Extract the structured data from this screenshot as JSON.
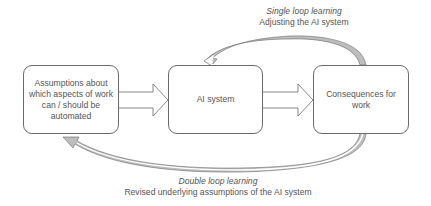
{
  "diagram": {
    "nodes": [
      {
        "id": "assumptions",
        "label": "Assumptions about which aspects of work can / should be automated"
      },
      {
        "id": "ai_system",
        "label": "AI system"
      },
      {
        "id": "consequences",
        "label": "Consequences for work"
      }
    ],
    "edges": [
      {
        "from": "assumptions",
        "to": "ai_system",
        "type": "block-arrow"
      },
      {
        "from": "ai_system",
        "to": "consequences",
        "type": "block-arrow"
      },
      {
        "from": "consequences",
        "to": "ai_system",
        "type": "curved-arrow",
        "name": "single-loop"
      },
      {
        "from": "consequences",
        "to": "assumptions",
        "type": "curved-arrow",
        "name": "double-loop"
      }
    ],
    "single_loop": {
      "title": "Single loop learning",
      "subtitle": "Adjusting the AI system"
    },
    "double_loop": {
      "title": "Double loop learning",
      "subtitle": "Revised underlying assumptions of the AI system"
    },
    "colors": {
      "stroke": "#6a6a6a",
      "shade": "#bdbdbd",
      "text": "#555555"
    }
  }
}
